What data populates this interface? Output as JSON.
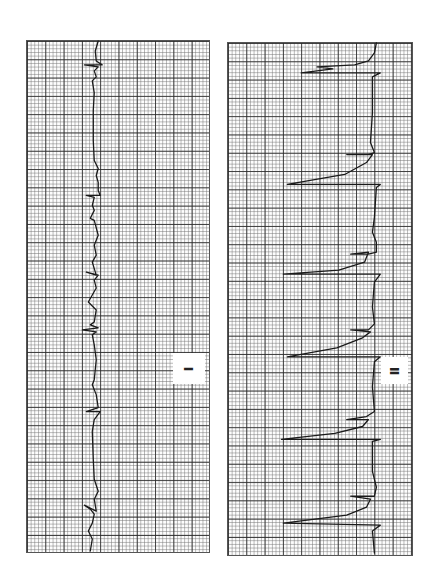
{
  "chart_data": {
    "type": "line",
    "orientation": "rotated_90_clockwise",
    "grid": true,
    "series": [
      {
        "name": "Lead I",
        "label": "I",
        "description": "Narrow-complex rhythm with small QRS deflections and repetitive low-amplitude waves",
        "beats_visible": 8,
        "points": [
          [
            72,
            0
          ],
          [
            69,
            10
          ],
          [
            70,
            20
          ],
          [
            76,
            24
          ],
          [
            58,
            24
          ],
          [
            72,
            26
          ],
          [
            68,
            30
          ],
          [
            70,
            36
          ],
          [
            66,
            40
          ],
          [
            68,
            52
          ],
          [
            67,
            70
          ],
          [
            67,
            100
          ],
          [
            68,
            120
          ],
          [
            72,
            128
          ],
          [
            70,
            135
          ],
          [
            72,
            142
          ],
          [
            72,
            150
          ],
          [
            74,
            155
          ],
          [
            60,
            155
          ],
          [
            68,
            157
          ],
          [
            66,
            165
          ],
          [
            68,
            170
          ],
          [
            64,
            178
          ],
          [
            68,
            180
          ],
          [
            72,
            195
          ],
          [
            68,
            205
          ],
          [
            70,
            215
          ],
          [
            66,
            222
          ],
          [
            70,
            235
          ],
          [
            60,
            232
          ],
          [
            72,
            235
          ],
          [
            68,
            240
          ],
          [
            70,
            248
          ],
          [
            66,
            255
          ],
          [
            62,
            262
          ],
          [
            70,
            270
          ],
          [
            68,
            282
          ],
          [
            64,
            285
          ],
          [
            72,
            288
          ],
          [
            56,
            290
          ],
          [
            70,
            292
          ],
          [
            66,
            295
          ],
          [
            68,
            305
          ],
          [
            70,
            320
          ],
          [
            68,
            340
          ],
          [
            66,
            345
          ],
          [
            70,
            355
          ],
          [
            72,
            368
          ],
          [
            60,
            372
          ],
          [
            74,
            372
          ],
          [
            68,
            380
          ],
          [
            66,
            392
          ],
          [
            67,
            420
          ],
          [
            68,
            440
          ],
          [
            72,
            452
          ],
          [
            68,
            460
          ],
          [
            70,
            472
          ],
          [
            58,
            466
          ],
          [
            64,
            470
          ],
          [
            68,
            475
          ],
          [
            66,
            484
          ],
          [
            62,
            492
          ],
          [
            66,
            500
          ],
          [
            64,
            512
          ]
        ]
      },
      {
        "name": "Lead II",
        "label": "II",
        "description": "Wide complexes with large deflections (sawtooth pattern)",
        "beats_visible": 7,
        "points": [
          [
            150,
            0
          ],
          [
            148,
            10
          ],
          [
            142,
            18
          ],
          [
            128,
            22
          ],
          [
            90,
            24
          ],
          [
            106,
            26
          ],
          [
            74,
            30
          ],
          [
            154,
            30
          ],
          [
            146,
            34
          ],
          [
            146,
            70
          ],
          [
            144,
            100
          ],
          [
            148,
            110
          ],
          [
            142,
            112
          ],
          [
            120,
            112
          ],
          [
            146,
            112
          ],
          [
            140,
            120
          ],
          [
            118,
            132
          ],
          [
            60,
            142
          ],
          [
            154,
            142
          ],
          [
            150,
            145
          ],
          [
            148,
            175
          ],
          [
            146,
            190
          ],
          [
            150,
            200
          ],
          [
            150,
            210
          ],
          [
            142,
            212
          ],
          [
            124,
            212
          ],
          [
            142,
            210
          ],
          [
            138,
            220
          ],
          [
            112,
            228
          ],
          [
            56,
            232
          ],
          [
            154,
            232
          ],
          [
            148,
            240
          ],
          [
            146,
            265
          ],
          [
            148,
            282
          ],
          [
            142,
            288
          ],
          [
            124,
            288
          ],
          [
            144,
            290
          ],
          [
            136,
            296
          ],
          [
            110,
            306
          ],
          [
            60,
            315
          ],
          [
            154,
            315
          ],
          [
            148,
            320
          ],
          [
            146,
            345
          ],
          [
            148,
            370
          ],
          [
            140,
            375
          ],
          [
            120,
            378
          ],
          [
            142,
            378
          ],
          [
            136,
            385
          ],
          [
            108,
            392
          ],
          [
            54,
            398
          ],
          [
            154,
            398
          ],
          [
            146,
            400
          ],
          [
            146,
            430
          ],
          [
            150,
            446
          ],
          [
            148,
            455
          ],
          [
            140,
            455
          ],
          [
            124,
            455
          ],
          [
            144,
            458
          ],
          [
            140,
            466
          ],
          [
            120,
            474
          ],
          [
            56,
            482
          ],
          [
            154,
            484
          ],
          [
            146,
            490
          ],
          [
            148,
            512
          ]
        ]
      }
    ],
    "xlabel": "",
    "ylabel": ""
  },
  "strips": [
    {
      "id": "lead-1",
      "label": "I"
    },
    {
      "id": "lead-2",
      "label": "II"
    }
  ],
  "colors": {
    "trace": "#1a1a1a",
    "grid_major": "#282828",
    "grid_minor": "#787878",
    "paper": "#fdfdfd"
  }
}
